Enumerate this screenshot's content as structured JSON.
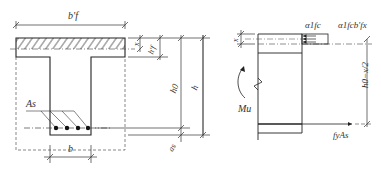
{
  "left_figure": {
    "title": "T-beam cross section",
    "labels": {
      "flange_width": "b'f",
      "flange_width_sub": "f",
      "compression_depth": "x",
      "flange_thickness": "h'f",
      "effective_depth": "h0",
      "total_height": "h",
      "steel_area": "As",
      "cover": "as",
      "web_width": "b"
    }
  },
  "right_figure": {
    "title": "Stress diagram",
    "labels": {
      "compression_depth": "x",
      "concrete_stress": "α1fc",
      "concrete_force": "α1fcb'fx",
      "lever_arm": "h0−x/2",
      "moment": "Mu",
      "steel_force": "fyAs"
    }
  }
}
